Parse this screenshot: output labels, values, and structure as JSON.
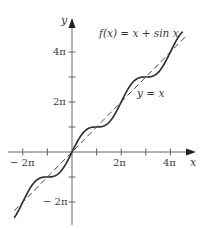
{
  "chart_data": {
    "type": "line",
    "title": "",
    "xlabel": "x",
    "ylabel": "y",
    "x_range": [
      "-2.4π",
      "4.6π"
    ],
    "y_range": [
      "-2.6π",
      "4.6π"
    ],
    "grid": false,
    "x_ticks": [
      {
        "value": "-2π",
        "label": "−2π"
      },
      {
        "value": "-π",
        "label": ""
      },
      {
        "value": "π",
        "label": ""
      },
      {
        "value": "2π",
        "label": "2π"
      },
      {
        "value": "3π",
        "label": ""
      },
      {
        "value": "4π",
        "label": "4π"
      }
    ],
    "y_ticks": [
      {
        "value": "4π",
        "label": "4π"
      },
      {
        "value": "3π",
        "label": ""
      },
      {
        "value": "2π",
        "label": "2π"
      },
      {
        "value": "π",
        "label": ""
      },
      {
        "value": "-π",
        "label": ""
      },
      {
        "value": "-2π",
        "label": "−2π"
      }
    ],
    "series": [
      {
        "name": "f(x) = x + sin x",
        "style": "solid",
        "expr": "x + sin(x)",
        "x_domain": [
          "-2.35π",
          "4.5π"
        ]
      },
      {
        "name": "y = x",
        "style": "dashed",
        "expr": "x",
        "x_domain": [
          "-2.35π",
          "4.6π"
        ]
      }
    ],
    "annotations": [
      {
        "text": "f(x) = x + sin x",
        "near": "upper right"
      },
      {
        "text": "y = x",
        "near": "dashed line at x≈2.6π"
      }
    ]
  },
  "labels": {
    "x_axis": "x",
    "y_axis": "y",
    "curve": "f(x) = x + sin x",
    "line": "y = x",
    "x_tick_neg2pi": "− 2π",
    "x_tick_2pi": "2π",
    "x_tick_4pi": "4π",
    "y_tick_4pi": "4π",
    "y_tick_2pi": "2π",
    "y_tick_neg2pi": "− 2π"
  },
  "colors": {
    "ink": "#333333",
    "background": "#ffffff"
  }
}
